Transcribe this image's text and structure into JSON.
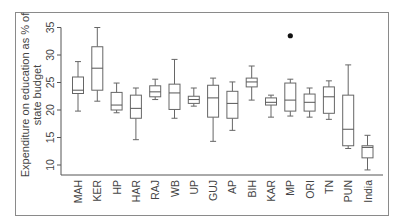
{
  "chart_data": {
    "type": "box",
    "title": "",
    "xlabel": "",
    "ylabel": "Expenditure on education as % of state budget",
    "ylabel_lines": [
      "Expenditure on education as % of",
      "state budget"
    ],
    "ylim": [
      8,
      36
    ],
    "yticks": [
      10,
      15,
      20,
      25,
      30,
      35
    ],
    "grid": false,
    "legend": null,
    "categories": [
      "MAH",
      "KER",
      "HP",
      "HAR",
      "RAJ",
      "WB",
      "UP",
      "GUJ",
      "AP",
      "BIH",
      "KAR",
      "MP",
      "ORI",
      "TN",
      "PUN",
      "India"
    ],
    "boxes": [
      {
        "label": "MAH",
        "whisker_low": 19.8,
        "q1": 23.0,
        "median": 23.6,
        "q3": 26.0,
        "whisker_high": 28.8,
        "outliers": []
      },
      {
        "label": "KER",
        "whisker_low": 21.6,
        "q1": 23.6,
        "median": 27.6,
        "q3": 31.5,
        "whisker_high": 35.0,
        "outliers": []
      },
      {
        "label": "HP",
        "whisker_low": 19.5,
        "q1": 20.0,
        "median": 20.9,
        "q3": 23.2,
        "whisker_high": 24.9,
        "outliers": []
      },
      {
        "label": "HAR",
        "whisker_low": 14.6,
        "q1": 18.5,
        "median": 20.3,
        "q3": 22.7,
        "whisker_high": 24.0,
        "outliers": []
      },
      {
        "label": "RAJ",
        "whisker_low": 21.9,
        "q1": 22.4,
        "median": 23.3,
        "q3": 24.4,
        "whisker_high": 25.6,
        "outliers": []
      },
      {
        "label": "WB",
        "whisker_low": 18.5,
        "q1": 20.1,
        "median": 23.1,
        "q3": 24.7,
        "whisker_high": 29.2,
        "outliers": []
      },
      {
        "label": "UP",
        "whisker_low": 20.7,
        "q1": 21.2,
        "median": 21.9,
        "q3": 22.5,
        "whisker_high": 24.0,
        "outliers": []
      },
      {
        "label": "GUJ",
        "whisker_low": 14.3,
        "q1": 18.7,
        "median": 22.2,
        "q3": 24.5,
        "whisker_high": 25.8,
        "outliers": []
      },
      {
        "label": "AP",
        "whisker_low": 16.3,
        "q1": 18.5,
        "median": 21.2,
        "q3": 23.4,
        "whisker_high": 25.1,
        "outliers": []
      },
      {
        "label": "BIH",
        "whisker_low": 21.8,
        "q1": 24.2,
        "median": 25.1,
        "q3": 25.8,
        "whisker_high": 28.0,
        "outliers": []
      },
      {
        "label": "KAR",
        "whisker_low": 18.7,
        "q1": 20.9,
        "median": 21.4,
        "q3": 22.2,
        "whisker_high": 22.7,
        "outliers": []
      },
      {
        "label": "MP",
        "whisker_low": 18.9,
        "q1": 19.8,
        "median": 21.8,
        "q3": 24.9,
        "whisker_high": 25.6,
        "outliers": [
          33.5
        ]
      },
      {
        "label": "ORI",
        "whisker_low": 18.7,
        "q1": 19.8,
        "median": 21.4,
        "q3": 22.9,
        "whisker_high": 24.0,
        "outliers": []
      },
      {
        "label": "TN",
        "whisker_low": 18.3,
        "q1": 19.4,
        "median": 22.4,
        "q3": 24.2,
        "whisker_high": 25.3,
        "outliers": []
      },
      {
        "label": "PUN",
        "whisker_low": 13.0,
        "q1": 13.5,
        "median": 16.5,
        "q3": 22.7,
        "whisker_high": 28.2,
        "outliers": []
      },
      {
        "label": "India",
        "whisker_low": 9.1,
        "q1": 11.3,
        "median": 13.2,
        "q3": 13.5,
        "whisker_high": 15.4,
        "outliers": []
      }
    ]
  },
  "colors": {
    "box_stroke": "#666666",
    "axis": "#555555",
    "text": "#444444",
    "outlier": "#111111",
    "frame": "#8a8a8a"
  }
}
